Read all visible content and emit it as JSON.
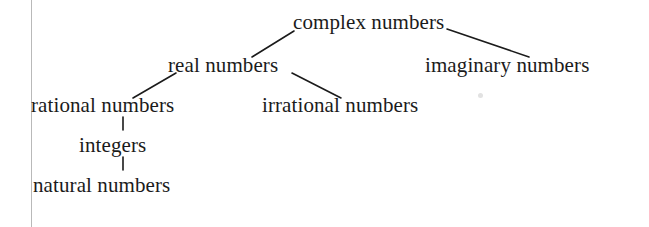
{
  "diagram": {
    "background_color": "#ffffff",
    "text_color": "#1b1b1b",
    "edge_color": "#1b1b1b",
    "margin_rule_color": "#b9b9b9",
    "nodes": [
      {
        "id": "complex",
        "label": "complex numbers",
        "x": 293,
        "y": 12,
        "level": 0
      },
      {
        "id": "real",
        "label": "real numbers",
        "x": 168,
        "y": 55,
        "level": 1
      },
      {
        "id": "imaginary",
        "label": "imaginary numbers",
        "x": 425,
        "y": 55,
        "level": 1
      },
      {
        "id": "rational",
        "label": "rational numbers",
        "x": 31,
        "y": 95,
        "level": 2
      },
      {
        "id": "irrational",
        "label": "irrational numbers",
        "x": 262,
        "y": 95,
        "level": 2
      },
      {
        "id": "integers",
        "label": "integers",
        "x": 79,
        "y": 135,
        "level": 3
      },
      {
        "id": "natural",
        "label": "natural numbers",
        "x": 33,
        "y": 175,
        "level": 4
      }
    ],
    "edges": [
      {
        "id": "complex-real",
        "from": "complex",
        "to": "real",
        "x1": 294,
        "y1": 31,
        "x2": 252,
        "y2": 57
      },
      {
        "id": "complex-imaginary",
        "from": "complex",
        "to": "imaginary",
        "x1": 447,
        "y1": 29,
        "x2": 529,
        "y2": 57
      },
      {
        "id": "real-rational",
        "from": "real",
        "to": "rational",
        "x1": 176,
        "y1": 73,
        "x2": 133,
        "y2": 98
      },
      {
        "id": "real-irrational",
        "from": "real",
        "to": "irrational",
        "x1": 292,
        "y1": 73,
        "x2": 341,
        "y2": 98
      },
      {
        "id": "rational-integers",
        "from": "rational",
        "to": "integers",
        "x1": 123,
        "y1": 117,
        "x2": 123,
        "y2": 130
      },
      {
        "id": "integers-natural",
        "from": "integers",
        "to": "natural",
        "x1": 123,
        "y1": 157,
        "x2": 123,
        "y2": 170
      }
    ],
    "artifacts": [
      {
        "id": "scan-speck",
        "x": 478,
        "y": 93
      }
    ]
  }
}
